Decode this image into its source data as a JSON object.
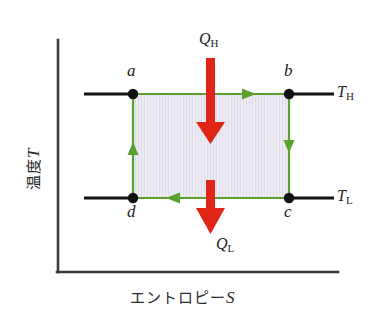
{
  "diagram": {
    "title_type": "T-S diagram (Carnot cycle)",
    "axes": {
      "y_label_text": "温度",
      "y_label_var": "T",
      "x_label_text": "エントロピー",
      "x_label_var": "S",
      "axis_color": "#333333"
    },
    "isotherms": [
      {
        "name": "high-temperature-isotherm",
        "label": "T",
        "sub": "H",
        "y": 94
      },
      {
        "name": "low-temperature-isotherm",
        "label": "T",
        "sub": "L",
        "y": 198
      }
    ],
    "states": [
      {
        "id": "a",
        "label": "a",
        "x": 133,
        "y": 94
      },
      {
        "id": "b",
        "label": "b",
        "x": 289,
        "y": 94
      },
      {
        "id": "c",
        "label": "c",
        "x": 289,
        "y": 198
      },
      {
        "id": "d",
        "label": "d",
        "x": 133,
        "y": 198
      }
    ],
    "cycle": {
      "color": "#5aa02c",
      "fill": "#e8e4ef",
      "direction": "clockwise",
      "segments": [
        {
          "from": "a",
          "to": "b",
          "arrow": "right"
        },
        {
          "from": "b",
          "to": "c",
          "arrow": "down"
        },
        {
          "from": "c",
          "to": "d",
          "arrow": "left"
        },
        {
          "from": "d",
          "to": "a",
          "arrow": "up"
        }
      ]
    },
    "heat_flows": [
      {
        "id": "QH",
        "label": "Q",
        "sub": "H",
        "color": "#e02415",
        "direction": "down",
        "position": "top"
      },
      {
        "id": "QL",
        "label": "Q",
        "sub": "L",
        "color": "#e02415",
        "direction": "down",
        "position": "bottom"
      }
    ]
  }
}
